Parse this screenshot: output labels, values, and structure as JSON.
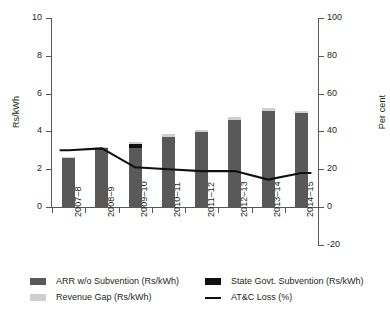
{
  "chart_data": {
    "type": "bar",
    "title": "",
    "subtitle": "",
    "xlabel": "",
    "ylabel": "Rs/kWh",
    "ylabel_secondary": "Per cent",
    "categories": [
      "2007–8",
      "2008–9",
      "2009–10",
      "2010–11",
      "2011–12",
      "2012–13",
      "2013–14",
      "2014–15"
    ],
    "ylim": [
      0,
      10
    ],
    "yticks": [
      0,
      2,
      4,
      6,
      8,
      10
    ],
    "ylim_secondary": [
      -20,
      100
    ],
    "yticks_secondary": [
      -20,
      0,
      20,
      40,
      60,
      80,
      100
    ],
    "grid": false,
    "legend_position": "bottom",
    "stacked": true,
    "series": [
      {
        "name": "ARR w/o Subvention (Rs/kWh)",
        "color": "#595959",
        "axis": "left",
        "kind": "bar",
        "values": [
          2.6,
          3.1,
          3.1,
          3.7,
          3.95,
          4.6,
          5.1,
          4.95
        ]
      },
      {
        "name": "State Govt. Subvention (Rs/kWh)",
        "color": "#101010",
        "axis": "left",
        "kind": "bar",
        "values": [
          0.0,
          0.0,
          0.25,
          0.0,
          0.0,
          0.0,
          0.0,
          0.0
        ]
      },
      {
        "name": "Revenue Gap (Rs/kWh)",
        "color": "#cfcfcf",
        "axis": "left",
        "kind": "bar",
        "values": [
          0.05,
          0.1,
          0.1,
          0.15,
          0.1,
          0.15,
          0.15,
          0.15
        ]
      },
      {
        "name": "AT&C Loss (%)",
        "color": "#101010",
        "axis": "right",
        "kind": "line",
        "values": [
          30,
          31,
          21,
          20,
          19,
          19,
          14.5,
          18
        ]
      }
    ]
  },
  "legend": {
    "items": [
      {
        "label": "ARR w/o Subvention (Rs/kWh)",
        "marker": "swatch",
        "color": "#595959"
      },
      {
        "label": "State Govt. Subvention (Rs/kWh)",
        "marker": "swatch",
        "color": "#101010"
      },
      {
        "label": "Revenue Gap (Rs/kWh)",
        "marker": "swatch",
        "color": "#cfcfcf"
      },
      {
        "label": "AT&C Loss (%)",
        "marker": "line",
        "color": "#101010"
      }
    ]
  }
}
